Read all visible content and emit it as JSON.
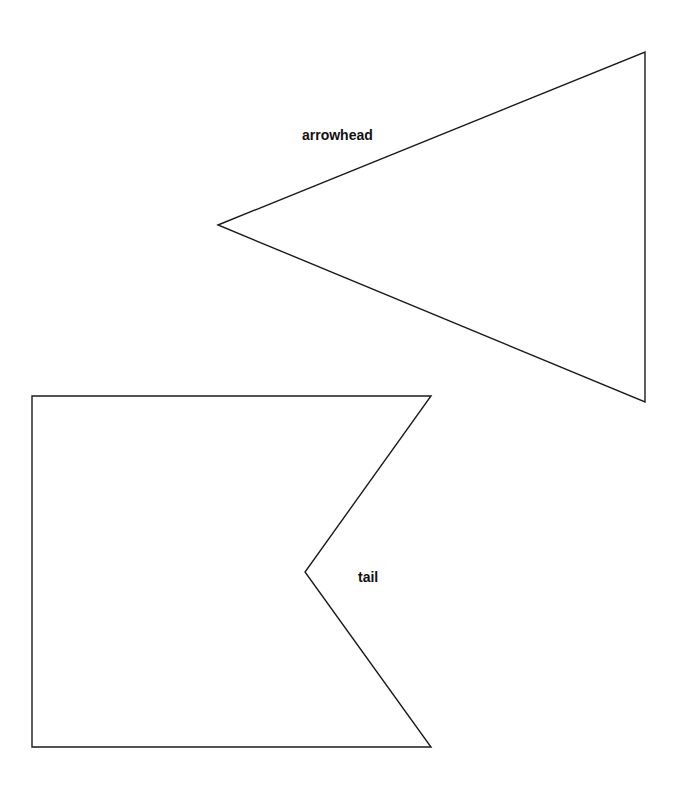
{
  "diagram": {
    "title": "",
    "shapes": [
      {
        "id": "arrowhead",
        "type": "triangle",
        "label": "arrowhead",
        "points": [
          [
            218,
            225
          ],
          [
            645,
            52
          ],
          [
            645,
            402
          ]
        ],
        "stroke": "#1a1a1a",
        "fill": "#ffffff"
      },
      {
        "id": "tail",
        "type": "notched-rectangle",
        "label": "tail",
        "points": [
          [
            32,
            396
          ],
          [
            431,
            396
          ],
          [
            305,
            572
          ],
          [
            431,
            747
          ],
          [
            32,
            747
          ]
        ],
        "stroke": "#1a1a1a",
        "fill": "#ffffff"
      }
    ],
    "labels": {
      "arrowhead": "arrowhead",
      "tail": "tail"
    }
  }
}
